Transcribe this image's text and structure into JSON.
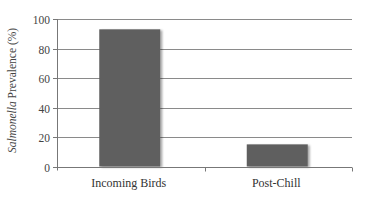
{
  "chart_data": {
    "type": "bar",
    "title": "",
    "xlabel": "",
    "ylabel": "Salmonella Prevalence (%)",
    "ylabel_italic_part": "Salmonella",
    "ylabel_rest": " Prevalence (%)",
    "categories": [
      "Incoming Birds",
      "Post-Chill"
    ],
    "values": [
      93,
      15
    ],
    "ylim": [
      0,
      100
    ],
    "yticks": [
      0,
      20,
      40,
      60,
      80,
      100
    ],
    "grid": true,
    "legend": null,
    "bar_color": "#5f5f5f"
  }
}
